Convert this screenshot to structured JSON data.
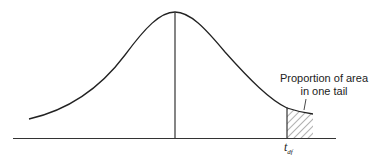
{
  "diagram": {
    "annotation": {
      "line1": "Proportion of area",
      "line2": "in one tail"
    },
    "critical_value": {
      "symbol": "t",
      "subscript": "df"
    },
    "colors": {
      "stroke": "#222222",
      "hatch": "#555555",
      "background": "#ffffff"
    }
  }
}
